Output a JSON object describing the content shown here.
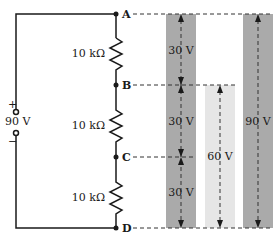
{
  "source": {
    "label": "90 V",
    "plus": "+",
    "minus": "−"
  },
  "resistors": [
    {
      "label": "10 kΩ"
    },
    {
      "label": "10 kΩ"
    },
    {
      "label": "10 kΩ"
    }
  ],
  "nodes": [
    "A",
    "B",
    "C",
    "D"
  ],
  "bars": [
    {
      "segments": [
        "30 V",
        "30 V",
        "30 V"
      ],
      "color": "#aaaaaa"
    },
    {
      "label": "60 V",
      "color": "#e6e6e6"
    },
    {
      "label": "90 V",
      "color": "#aaaaaa"
    }
  ],
  "colors": {
    "wire": "#1a1a1a",
    "dash": "#333333"
  }
}
